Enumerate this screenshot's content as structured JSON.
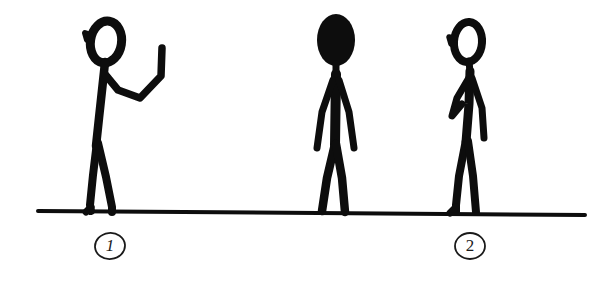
{
  "scene": {
    "title": "Hand-drawn stick figure sketch",
    "background_color": "#ffffff",
    "ink_color": "#0d0d0d",
    "width": 591,
    "height": 281
  },
  "ground": {
    "name": "ground line",
    "x1": 38,
    "y1": 211,
    "x2": 585,
    "y2": 215,
    "thickness": 4
  },
  "figures": [
    {
      "id": "figure-1",
      "pose": "standing, facing left, right arm raised and bent at elbow with hand up",
      "head_style": "outline",
      "head_center_x": 105,
      "head_center_y": 42,
      "label": "1"
    },
    {
      "id": "figure-2",
      "pose": "standing frontal, arms at sides, legs slightly apart",
      "head_style": "filled",
      "head_center_x": 336,
      "head_center_y": 40,
      "label": ""
    },
    {
      "id": "figure-3",
      "pose": "standing, facing left, one arm bent across chest, one arm hanging down",
      "head_style": "outline",
      "head_center_x": 466,
      "head_center_y": 42,
      "label": "2"
    }
  ],
  "callouts": [
    {
      "id": "callout-1",
      "text": "1",
      "shape": "circle",
      "center_x": 110,
      "center_y": 246,
      "radius": 14
    },
    {
      "id": "callout-2",
      "text": "2",
      "shape": "circle",
      "center_x": 470,
      "center_y": 246,
      "radius": 14
    }
  ]
}
